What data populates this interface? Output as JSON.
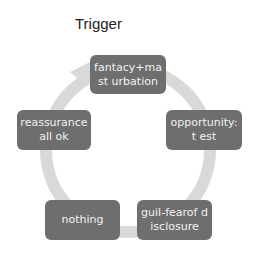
{
  "title": "Trigger",
  "colors": {
    "node_fill": "#6e6e6e",
    "node_text": "#f2f2f2",
    "arc": "#d9d9d9"
  },
  "nodes": [
    {
      "id": "top",
      "label": "fantacy+mast urbation"
    },
    {
      "id": "right",
      "label": "opportunity:t est"
    },
    {
      "id": "bottom-right",
      "label": "guil-fearof disclosure"
    },
    {
      "id": "bottom-left",
      "label": "nothing"
    },
    {
      "id": "left",
      "label": "reassurance all ok"
    }
  ]
}
